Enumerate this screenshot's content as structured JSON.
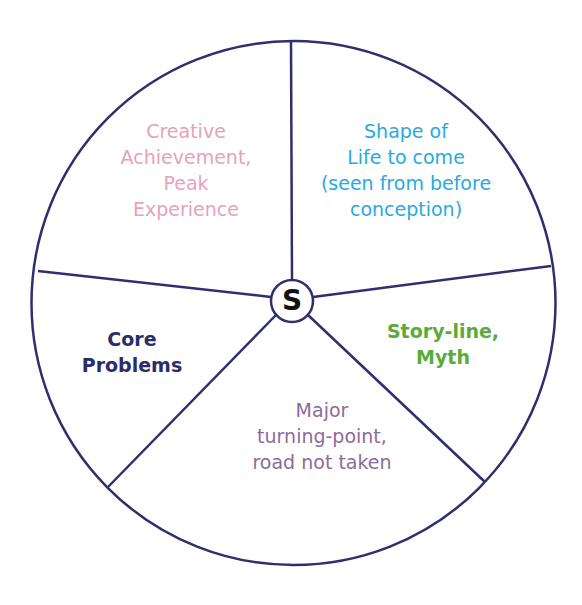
{
  "diagram": {
    "center_label": "S",
    "line_color": "#2f2f6e",
    "segments": [
      {
        "id": "creative",
        "lines": [
          "Creative",
          "Achievement,",
          "Peak",
          "Experience"
        ],
        "color": "#e6a2bc",
        "weight": "normal"
      },
      {
        "id": "shape-of-life",
        "lines": [
          "Shape of",
          "Life to come",
          "(seen from before",
          "conception)"
        ],
        "color": "#2aa9e0",
        "weight": "normal"
      },
      {
        "id": "story-line",
        "lines": [
          "Story-line,",
          "Myth"
        ],
        "color": "#5aab3a",
        "weight": "bold"
      },
      {
        "id": "turning-point",
        "lines": [
          "Major",
          "turning-point,",
          "road not taken"
        ],
        "color": "#8e6a9c",
        "weight": "normal"
      },
      {
        "id": "core-problems",
        "lines": [
          "Core",
          "Problems"
        ],
        "color": "#2b2d6b",
        "weight": "bold"
      }
    ]
  }
}
